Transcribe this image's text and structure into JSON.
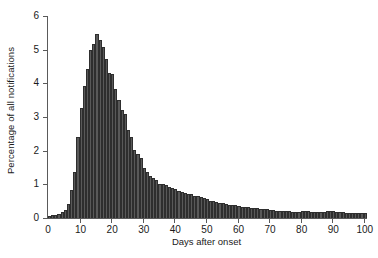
{
  "chart_data": {
    "type": "bar",
    "title": "",
    "subtitle": "",
    "xlabel": "Days after onset",
    "ylabel": "Percentage of all notifications",
    "xlim": [
      0,
      101
    ],
    "ylim": [
      0,
      6
    ],
    "grid": false,
    "legend": null,
    "bar_color": "#595959",
    "bar_edge_color": "#2e2e2e",
    "axis_color": "#5a5a5a",
    "yticks": [
      0,
      1,
      2,
      3,
      4,
      5,
      6
    ],
    "ytick_labels": [
      "0",
      "1",
      "2",
      "3",
      "4",
      "5",
      "6"
    ],
    "xticks": [
      10,
      20,
      30,
      40,
      50,
      60,
      70,
      80,
      90,
      100
    ],
    "xtick_labels": [
      "10",
      "20",
      "30",
      "40",
      "50",
      "60",
      "70",
      "80",
      "90",
      "100"
    ],
    "x_origin_label": "0",
    "categories": [
      1,
      2,
      3,
      4,
      5,
      6,
      7,
      8,
      9,
      10,
      11,
      12,
      13,
      14,
      15,
      16,
      17,
      18,
      19,
      20,
      21,
      22,
      23,
      24,
      25,
      26,
      27,
      28,
      29,
      30,
      31,
      32,
      33,
      34,
      35,
      36,
      37,
      38,
      39,
      40,
      41,
      42,
      43,
      44,
      45,
      46,
      47,
      48,
      49,
      50,
      51,
      52,
      53,
      54,
      55,
      56,
      57,
      58,
      59,
      60,
      61,
      62,
      63,
      64,
      65,
      66,
      67,
      68,
      69,
      70,
      71,
      72,
      73,
      74,
      75,
      76,
      77,
      78,
      79,
      80,
      81,
      82,
      83,
      84,
      85,
      86,
      87,
      88,
      89,
      90,
      91,
      92,
      93,
      94,
      95,
      96,
      97,
      98,
      99,
      100,
      101
    ],
    "values": [
      0.05,
      0.08,
      0.1,
      0.13,
      0.18,
      0.25,
      0.42,
      0.82,
      1.38,
      2.42,
      3.28,
      3.92,
      4.42,
      5.0,
      5.18,
      5.48,
      5.3,
      5.08,
      4.72,
      4.3,
      4.28,
      3.82,
      3.52,
      3.22,
      3.1,
      2.62,
      2.4,
      2.02,
      1.9,
      1.78,
      1.5,
      1.38,
      1.26,
      1.2,
      1.12,
      1.02,
      1.0,
      0.98,
      0.92,
      0.88,
      0.86,
      0.8,
      0.78,
      0.74,
      0.72,
      0.7,
      0.66,
      0.64,
      0.62,
      0.58,
      0.56,
      0.52,
      0.5,
      0.48,
      0.46,
      0.44,
      0.42,
      0.4,
      0.39,
      0.38,
      0.36,
      0.34,
      0.33,
      0.32,
      0.31,
      0.3,
      0.29,
      0.28,
      0.27,
      0.26,
      0.24,
      0.23,
      0.22,
      0.22,
      0.21,
      0.2,
      0.2,
      0.19,
      0.19,
      0.18,
      0.2,
      0.21,
      0.2,
      0.19,
      0.18,
      0.18,
      0.17,
      0.17,
      0.2,
      0.22,
      0.2,
      0.18,
      0.17,
      0.17,
      0.16,
      0.16,
      0.15,
      0.15,
      0.15,
      0.16,
      0.15
    ]
  },
  "caption": ""
}
